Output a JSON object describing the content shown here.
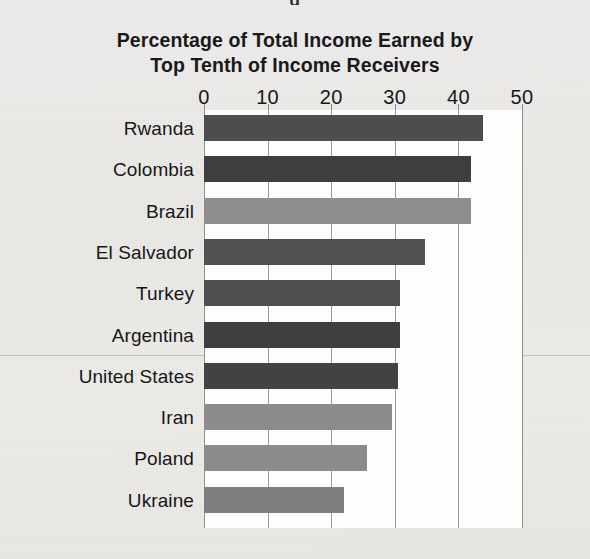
{
  "page": {
    "top_cut_glyph": "g",
    "background_hex": "#ebe9e6",
    "plot_background_hex": "#fdfdfc"
  },
  "chart_data": {
    "type": "bar",
    "orientation": "horizontal",
    "title": "Percentage of Total Income Earned by Top Tenth of Income Receivers",
    "title_lines": [
      "Percentage of Total Income Earned by",
      "Top Tenth of Income Receivers"
    ],
    "xlabel": "",
    "ylabel": "",
    "xlim": [
      0,
      50
    ],
    "xticks": [
      0,
      10,
      20,
      30,
      40,
      50
    ],
    "xtick_labels": [
      "0",
      "10",
      "20",
      "30",
      "40",
      "50"
    ],
    "axis_position": "top",
    "grid": true,
    "grid_axis": "x",
    "legend": false,
    "categories": [
      "Rwanda",
      "Colombia",
      "Brazil",
      "El Salvador",
      "Turkey",
      "Argentina",
      "United States",
      "Iran",
      "Poland",
      "Ukraine"
    ],
    "values": [
      43.9,
      42.0,
      42.0,
      34.7,
      30.8,
      30.8,
      30.5,
      29.5,
      25.6,
      22.0
    ],
    "bar_colors": [
      "#4d4d4f",
      "#3e3e40",
      "#8e8e90",
      "#515153",
      "#4f4f51",
      "#3f3f41",
      "#424244",
      "#8b8b8d",
      "#8b8b8d",
      "#7e7e80"
    ],
    "bars": [
      {
        "label": "Rwanda",
        "value": 43.9,
        "color": "#4d4d4f"
      },
      {
        "label": "Colombia",
        "value": 42.0,
        "color": "#3e3e40"
      },
      {
        "label": "Brazil",
        "value": 42.0,
        "color": "#8e8e90"
      },
      {
        "label": "El Salvador",
        "value": 34.7,
        "color": "#515153"
      },
      {
        "label": "Turkey",
        "value": 30.8,
        "color": "#4f4f51"
      },
      {
        "label": "Argentina",
        "value": 30.8,
        "color": "#3f3f41"
      },
      {
        "label": "United States",
        "value": 30.5,
        "color": "#424244"
      },
      {
        "label": "Iran",
        "value": 29.5,
        "color": "#8b8b8d"
      },
      {
        "label": "Poland",
        "value": 25.6,
        "color": "#8b8b8d"
      },
      {
        "label": "Ukraine",
        "value": 22.0,
        "color": "#7e7e80"
      }
    ]
  }
}
